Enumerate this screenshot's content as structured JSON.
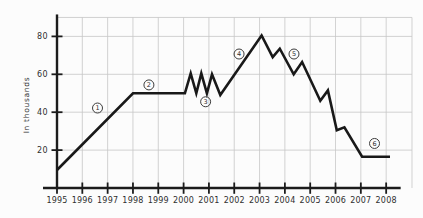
{
  "chart": {
    "colors": {
      "background": "#fcfcfc",
      "line": "#191919",
      "axis": "#1c1c1c",
      "grid": "#c7c7c7",
      "text": "#323232",
      "annotation_stroke": "#3c3c3c"
    },
    "ylabel": "In thousands"
  },
  "chart_data": {
    "type": "line",
    "ylabel": "In thousands",
    "xlabel": "",
    "x_ticks": [
      "1995",
      "1996",
      "1997",
      "1998",
      "1999",
      "2000",
      "2001",
      "2002",
      "2003",
      "2004",
      "2005",
      "2006",
      "2007",
      "2008"
    ],
    "y_ticks": [
      20,
      40,
      60,
      80
    ],
    "xlim": [
      1995,
      2009.02
    ],
    "ylim": [
      0,
      90
    ],
    "grid": true,
    "grid_x_years": [
      1996,
      1997,
      1998,
      1999,
      2000,
      2001,
      2002,
      2003,
      2004,
      2005,
      2006,
      2007,
      2008,
      2009.02
    ],
    "grid_y_values": [
      20,
      40,
      60,
      80,
      90
    ],
    "series": [
      {
        "points": [
          [
            1995.0,
            9.5
          ],
          [
            1998.0,
            50
          ],
          [
            2000.05,
            50
          ],
          [
            2000.28,
            60.5
          ],
          [
            2000.5,
            50
          ],
          [
            2000.7,
            60.5
          ],
          [
            2000.92,
            50
          ],
          [
            2001.12,
            60
          ],
          [
            2001.45,
            49
          ],
          [
            2003.08,
            80.5
          ],
          [
            2003.52,
            69
          ],
          [
            2003.8,
            73.5
          ],
          [
            2004.35,
            60
          ],
          [
            2004.68,
            66.5
          ],
          [
            2005.4,
            46
          ],
          [
            2005.7,
            51.5
          ],
          [
            2006.05,
            30.5
          ],
          [
            2006.35,
            32
          ],
          [
            2007.05,
            16.5
          ],
          [
            2008.15,
            16.5
          ]
        ]
      }
    ],
    "annotations": [
      {
        "label": "1",
        "x": 1996.6,
        "y": 42.2
      },
      {
        "label": "2",
        "x": 1998.63,
        "y": 54.4
      },
      {
        "label": "3",
        "x": 2000.87,
        "y": 45.5
      },
      {
        "label": "4",
        "x": 2002.19,
        "y": 70.7
      },
      {
        "label": "5",
        "x": 2004.36,
        "y": 70.7
      },
      {
        "label": "6",
        "x": 2007.54,
        "y": 23.5
      }
    ]
  }
}
